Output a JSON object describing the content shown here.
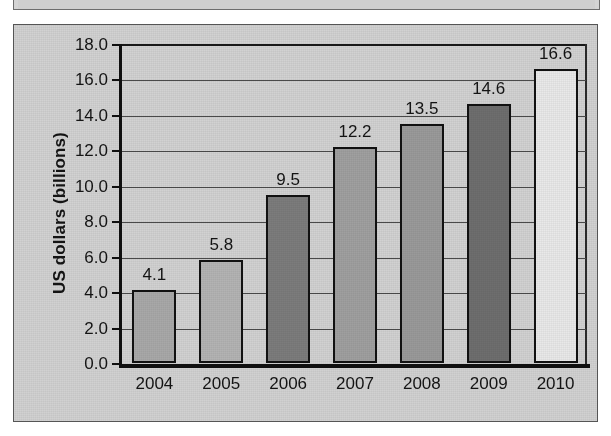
{
  "chart_data": {
    "type": "bar",
    "title": "",
    "subtitle": "",
    "xlabel": "",
    "ylabel": "US dollars (billions)",
    "categories": [
      "2004",
      "2005",
      "2006",
      "2007",
      "2008",
      "2009",
      "2010"
    ],
    "values": [
      4.1,
      5.8,
      9.5,
      12.2,
      13.5,
      14.6,
      16.6
    ],
    "value_labels": [
      "4.1",
      "5.8",
      "9.5",
      "12.2",
      "13.5",
      "14.6",
      "16.6"
    ],
    "bar_colors": [
      "#a9a9a9",
      "#b4b4b4",
      "#7c7c7c",
      "#a0a0a0",
      "#9a9a9a",
      "#6e6e6e",
      "#e9e9e9"
    ],
    "ylim": [
      0.0,
      18.0
    ],
    "ytick_values": [
      0.0,
      2.0,
      4.0,
      6.0,
      8.0,
      10.0,
      12.0,
      14.0,
      16.0,
      18.0
    ],
    "ytick_labels": [
      "0.0",
      "2.0",
      "4.0",
      "6.0",
      "8.0",
      "10.0",
      "12.0",
      "14.0",
      "16.0",
      "18.0"
    ],
    "grid": true,
    "grid_axis": "y",
    "legend": false,
    "legend_position": "none",
    "plot_background": "#d2d2d2",
    "axis_color": "#111111",
    "text_color": "#141414",
    "annotations": []
  }
}
